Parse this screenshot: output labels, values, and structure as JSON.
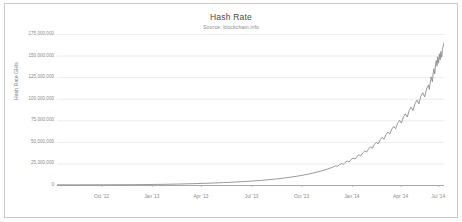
{
  "chart_data": {
    "type": "line",
    "title": "Hash Rate",
    "subtitle": "Source: blockchain.info",
    "xlabel": "",
    "ylabel": "Hash Rate GH/s",
    "grid": true,
    "legend": false,
    "ylim": [
      0,
      175000000
    ],
    "y_ticks": [
      0,
      25000000,
      50000000,
      75000000,
      100000000,
      125000000,
      150000000,
      175000000
    ],
    "y_tick_labels": [
      "0",
      "25,000,000",
      "50,000,000",
      "75,000,000",
      "100,000,000",
      "125,000,000",
      "150,000,000",
      "175,000,000"
    ],
    "x_tick_labels": [
      "Oct '12",
      "Jan '13",
      "Apr '13",
      "Jul '13",
      "Oct '13",
      "Jan '14",
      "Apr '14",
      "Jul '14"
    ],
    "x_tick_positions": [
      0.115,
      0.245,
      0.372,
      0.503,
      0.632,
      0.762,
      0.888,
      0.985
    ],
    "line_color": "#8c8c8c",
    "grid_color": "#ececec",
    "axis_color": "#a8a8a8",
    "x_range": [
      "2012-08",
      "2014-08"
    ],
    "series": [
      {
        "name": "Hash Rate GH/s",
        "points": [
          [
            0.0,
            200000
          ],
          [
            0.01,
            210000
          ],
          [
            0.02,
            215000
          ],
          [
            0.03,
            222000
          ],
          [
            0.04,
            228000
          ],
          [
            0.05,
            235000
          ],
          [
            0.06,
            244000
          ],
          [
            0.07,
            252000
          ],
          [
            0.08,
            260000
          ],
          [
            0.09,
            268000
          ],
          [
            0.1,
            276000
          ],
          [
            0.11,
            284000
          ],
          [
            0.12,
            292000
          ],
          [
            0.13,
            300000
          ],
          [
            0.14,
            310000
          ],
          [
            0.15,
            322000
          ],
          [
            0.16,
            336000
          ],
          [
            0.17,
            352000
          ],
          [
            0.18,
            370000
          ],
          [
            0.19,
            392000
          ],
          [
            0.2,
            418000
          ],
          [
            0.21,
            450000
          ],
          [
            0.22,
            485000
          ],
          [
            0.23,
            525000
          ],
          [
            0.24,
            570000
          ],
          [
            0.25,
            620000
          ],
          [
            0.26,
            680000
          ],
          [
            0.27,
            745000
          ],
          [
            0.28,
            820000
          ],
          [
            0.29,
            900000
          ],
          [
            0.3,
            985000
          ],
          [
            0.31,
            1080000
          ],
          [
            0.32,
            1180000
          ],
          [
            0.33,
            1290000
          ],
          [
            0.34,
            1400000
          ],
          [
            0.35,
            1520000
          ],
          [
            0.36,
            1650000
          ],
          [
            0.37,
            1790000
          ],
          [
            0.38,
            1930000
          ],
          [
            0.39,
            2080000
          ],
          [
            0.4,
            2240000
          ],
          [
            0.41,
            2410000
          ],
          [
            0.42,
            2590000
          ],
          [
            0.43,
            2780000
          ],
          [
            0.44,
            2980000
          ],
          [
            0.45,
            3190000
          ],
          [
            0.46,
            3420000
          ],
          [
            0.47,
            3660000
          ],
          [
            0.48,
            3920000
          ],
          [
            0.49,
            4190000
          ],
          [
            0.5,
            4480000
          ],
          [
            0.51,
            4790000
          ],
          [
            0.52,
            5120000
          ],
          [
            0.53,
            5480000
          ],
          [
            0.54,
            5860000
          ],
          [
            0.55,
            6270000
          ],
          [
            0.56,
            6710000
          ],
          [
            0.57,
            7190000
          ],
          [
            0.58,
            7700000
          ],
          [
            0.59,
            8260000
          ],
          [
            0.6,
            8860000
          ],
          [
            0.61,
            9510000
          ],
          [
            0.62,
            10200000
          ],
          [
            0.63,
            10960000
          ],
          [
            0.64,
            11780000
          ],
          [
            0.65,
            12680000
          ],
          [
            0.66,
            13660000
          ],
          [
            0.67,
            14740000
          ],
          [
            0.68,
            15920000
          ],
          [
            0.69,
            17220000
          ],
          [
            0.7,
            18650000
          ],
          [
            0.71,
            20230000
          ],
          [
            0.715,
            21080000
          ],
          [
            0.72,
            22300000
          ],
          [
            0.725,
            21600000
          ],
          [
            0.73,
            23600000
          ],
          [
            0.735,
            24800000
          ],
          [
            0.74,
            24000000
          ],
          [
            0.745,
            26200000
          ],
          [
            0.75,
            27800000
          ],
          [
            0.755,
            26900000
          ],
          [
            0.76,
            29500000
          ],
          [
            0.765,
            31200000
          ],
          [
            0.77,
            30100000
          ],
          [
            0.775,
            33000000
          ],
          [
            0.78,
            35000000
          ],
          [
            0.785,
            33800000
          ],
          [
            0.79,
            37200000
          ],
          [
            0.795,
            39400000
          ],
          [
            0.8,
            38100000
          ],
          [
            0.805,
            41800000
          ],
          [
            0.81,
            44200000
          ],
          [
            0.815,
            42600000
          ],
          [
            0.82,
            46800000
          ],
          [
            0.825,
            49500000
          ],
          [
            0.83,
            47600000
          ],
          [
            0.835,
            52300000
          ],
          [
            0.84,
            55200000
          ],
          [
            0.845,
            53000000
          ],
          [
            0.85,
            58200000
          ],
          [
            0.855,
            61400000
          ],
          [
            0.86,
            59000000
          ],
          [
            0.865,
            64600000
          ],
          [
            0.87,
            68000000
          ],
          [
            0.875,
            65200000
          ],
          [
            0.88,
            71400000
          ],
          [
            0.885,
            75000000
          ],
          [
            0.89,
            71800000
          ],
          [
            0.895,
            78600000
          ],
          [
            0.9,
            82400000
          ],
          [
            0.905,
            78800000
          ],
          [
            0.91,
            86200000
          ],
          [
            0.915,
            90200000
          ],
          [
            0.92,
            86200000
          ],
          [
            0.925,
            94200000
          ],
          [
            0.93,
            98400000
          ],
          [
            0.935,
            94000000
          ],
          [
            0.94,
            102600000
          ],
          [
            0.945,
            107000000
          ],
          [
            0.95,
            102200000
          ],
          [
            0.955,
            111400000
          ],
          [
            0.96,
            116000000
          ],
          [
            0.962,
            110800000
          ],
          [
            0.965,
            120600000
          ],
          [
            0.967,
            125400000
          ],
          [
            0.97,
            119600000
          ],
          [
            0.972,
            129800000
          ],
          [
            0.974,
            134800000
          ],
          [
            0.976,
            128600000
          ],
          [
            0.978,
            139200000
          ],
          [
            0.98,
            144400000
          ],
          [
            0.982,
            137800000
          ],
          [
            0.984,
            148600000
          ],
          [
            0.986,
            141200000
          ],
          [
            0.988,
            152000000
          ],
          [
            0.99,
            145000000
          ],
          [
            0.992,
            154800000
          ],
          [
            0.994,
            148000000
          ],
          [
            0.996,
            157000000
          ],
          [
            0.998,
            161000000
          ],
          [
            1.0,
            165000000
          ]
        ]
      }
    ]
  }
}
